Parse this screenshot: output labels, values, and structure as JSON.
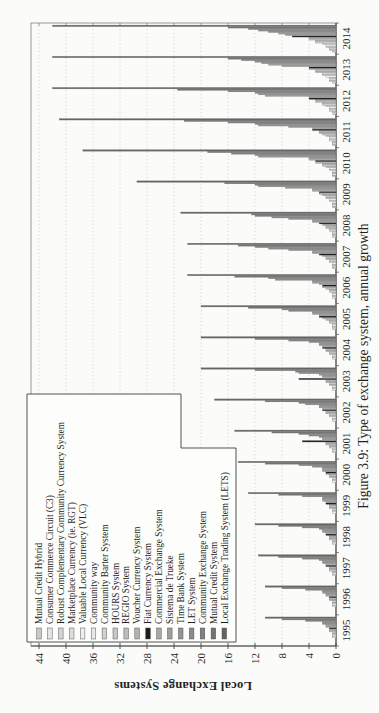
{
  "page": {
    "background": "#fbfbf9"
  },
  "figure": {
    "caption": "Figure 3.9: Type of exchange system, annual growth"
  },
  "chart_data": {
    "type": "bar",
    "title": "",
    "xlabel": "",
    "ylabel": "Local Exchange Systems",
    "ylim": [
      0,
      44
    ],
    "ytick_step": 4,
    "grid": "horizontal dotted gridlines at each y tick",
    "legend_position": "upper-left, white notched box",
    "rotated_on_page": "figure rotated 90 degrees counter-clockwise on portrait page",
    "categories": [
      "1995",
      "1996",
      "1997",
      "1998",
      "1999",
      "2000",
      "2001",
      "2002",
      "2003",
      "2004",
      "2005",
      "2006",
      "2007",
      "2008",
      "2009",
      "2010",
      "2011",
      "2012",
      "2013",
      "2014"
    ],
    "series": [
      {
        "name": "Mutual Credit Hybrid",
        "color": "#c9c9c9",
        "values": [
          0,
          0,
          0,
          0,
          0,
          0,
          0,
          0,
          0,
          0,
          0,
          0,
          0,
          0,
          0.5,
          0.5,
          0.5,
          0.5,
          0.5,
          0.5
        ]
      },
      {
        "name": "Consumer Commerce Circuit (C3)",
        "color": "#e3e3e3",
        "values": [
          0,
          0,
          0,
          0,
          0,
          0,
          0,
          0,
          0,
          0,
          0,
          0,
          0.5,
          0.5,
          0.5,
          0.5,
          0.5,
          0.5,
          1,
          1
        ]
      },
      {
        "name": "Robust Complementary Community Currency System",
        "color": "#d4d4d4",
        "values": [
          0,
          0,
          0,
          0,
          0,
          0,
          0,
          0,
          0,
          0,
          0.5,
          0.5,
          0.5,
          0.5,
          0.5,
          0.5,
          0.5,
          1,
          1,
          1
        ]
      },
      {
        "name": "Marketplace Currency (ie. RGT)",
        "color": "#dddddd",
        "values": [
          0,
          0,
          0,
          0,
          0,
          0,
          0.5,
          0.5,
          0.5,
          0.5,
          0.5,
          0.5,
          0.5,
          0.5,
          0.5,
          0.5,
          1,
          1,
          1,
          1.5
        ]
      },
      {
        "name": "Valuable Local Currency (VLC)",
        "color": "#eeeeee",
        "values": [
          0.5,
          0.5,
          0.5,
          0.5,
          0.5,
          0.5,
          0.5,
          0.5,
          0.5,
          0.5,
          0.5,
          0.5,
          0.5,
          0.5,
          1,
          1,
          1,
          1,
          1.5,
          1.5
        ]
      },
      {
        "name": "Community way",
        "color": "#e8e8e8",
        "values": [
          0.5,
          0.5,
          0.5,
          0.5,
          0.5,
          0.5,
          0.5,
          0.5,
          0.5,
          0.5,
          0.5,
          0.5,
          1,
          1,
          1,
          1,
          1,
          1.5,
          2,
          2
        ]
      },
      {
        "name": "Community Barter System",
        "color": "#d0d0d0",
        "values": [
          0.5,
          0.5,
          0.5,
          0.5,
          0.5,
          0.5,
          1,
          1,
          1,
          1,
          1,
          1,
          1,
          1,
          1.5,
          1.5,
          1.5,
          2,
          2,
          3
        ]
      },
      {
        "name": "HOURS System",
        "color": "#c6c6c6",
        "values": [
          0.5,
          0.5,
          1,
          1,
          1,
          1,
          1,
          1,
          1,
          1,
          1,
          1,
          1.5,
          1.5,
          1.5,
          2,
          2,
          2,
          3,
          3
        ]
      },
      {
        "name": "REGIO System",
        "color": "#bcbcbc",
        "values": [
          1,
          1,
          1,
          1,
          1,
          1,
          1.5,
          1.5,
          1.5,
          1.5,
          1.5,
          1.5,
          1.5,
          1.5,
          2,
          2,
          2.5,
          3,
          3,
          4
        ]
      },
      {
        "name": "Voucher Currency System",
        "color": "#b2b2b2",
        "values": [
          1,
          1,
          1,
          1,
          1,
          1.5,
          1.5,
          1.5,
          1.5,
          1.5,
          2,
          2,
          2,
          2,
          2.5,
          3,
          2.5,
          3,
          4,
          4
        ]
      },
      {
        "name": "Fiat Currency System",
        "color": "#1c1c1c",
        "values": [
          1,
          1,
          1.5,
          1.5,
          1.5,
          1.5,
          5,
          2,
          5.5,
          2,
          2.5,
          2,
          2.5,
          2.5,
          2.5,
          3,
          3.5,
          4,
          4,
          6.5
        ]
      },
      {
        "name": "Commercial Exchange System",
        "color": "#a8a8a8",
        "values": [
          1.5,
          1.5,
          1.5,
          1.5,
          1.5,
          2,
          2,
          2,
          2,
          2,
          2.5,
          2.5,
          3.5,
          3.5,
          3.5,
          4,
          3.5,
          4,
          8,
          7.5
        ]
      },
      {
        "name": "Sistema de Trueke",
        "color": "#9e9e9e",
        "values": [
          1.5,
          1.5,
          2,
          2,
          2,
          2,
          2,
          2.5,
          2,
          2.5,
          3.5,
          3.5,
          3.5,
          3.5,
          3.5,
          4,
          7,
          10.5,
          10,
          8.5
        ]
      },
      {
        "name": "Time Bank System",
        "color": "#949494",
        "values": [
          2,
          2,
          2,
          2,
          2,
          2,
          2.5,
          2.5,
          2.5,
          2.5,
          3.5,
          3.5,
          7,
          7,
          7.5,
          11.5,
          11.5,
          11.5,
          11,
          10
        ]
      },
      {
        "name": "LET System",
        "color": "#8a8a8a",
        "values": [
          2,
          2,
          2.5,
          2.5,
          2,
          3.5,
          4,
          4.5,
          5.5,
          4,
          7,
          9,
          10,
          9.5,
          11.5,
          12,
          12,
          12,
          12,
          11.5
        ]
      },
      {
        "name": "Community Exchange System",
        "color": "#808080",
        "values": [
          4.5,
          4.5,
          5,
          5,
          5,
          5.5,
          5.5,
          5.5,
          6,
          7,
          8,
          10,
          12,
          12,
          12,
          15.5,
          16,
          16,
          14,
          13
        ]
      },
      {
        "name": "Mutual Credit System",
        "color": "#747474",
        "values": [
          8,
          8,
          8.5,
          8.5,
          8.5,
          10.5,
          9.5,
          10.5,
          12,
          12,
          13,
          15,
          14.5,
          12.5,
          16.5,
          19,
          22.5,
          23.5,
          16,
          16
        ]
      },
      {
        "name": "Local Exchange Trading System (LETS)",
        "color": "#656565",
        "values": [
          10.5,
          10.5,
          11.5,
          12,
          13,
          14.5,
          15,
          18,
          20,
          20,
          20,
          22,
          22,
          23,
          29.5,
          37.5,
          41,
          42,
          42,
          42
        ]
      }
    ]
  }
}
